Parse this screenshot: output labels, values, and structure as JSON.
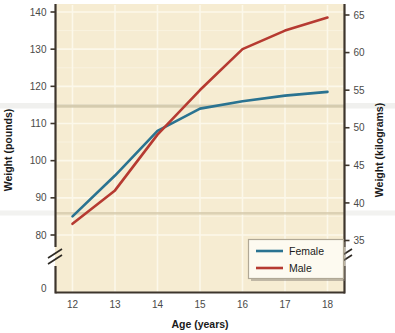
{
  "chart_data": {
    "type": "line",
    "title": "",
    "xlabel": "Age (years)",
    "ylabel": "Weight (pounds)",
    "y2label": "Weight (kilograms)",
    "x": [
      12,
      13,
      14,
      15,
      16,
      17,
      18
    ],
    "xtick_labels": [
      "12",
      "13",
      "14",
      "15",
      "16",
      "17",
      "18"
    ],
    "xlim": [
      11.6,
      18.4
    ],
    "ytick_labels": [
      "0",
      "80",
      "90",
      "100",
      "110",
      "120",
      "130",
      "140"
    ],
    "yticks": [
      0,
      80,
      90,
      100,
      110,
      120,
      130,
      140
    ],
    "ylim": [
      80,
      142
    ],
    "y_axis_break": true,
    "y2tick_labels": [
      "35",
      "40",
      "45",
      "50",
      "55",
      "60",
      "65"
    ],
    "y2ticks": [
      35,
      40,
      45,
      50,
      55,
      60,
      65
    ],
    "y2_axis_break": true,
    "grid": true,
    "legend_position": "bottom-right",
    "series": [
      {
        "name": "Female",
        "color": "#2a7391",
        "values": [
          85,
          96,
          108,
          114,
          116,
          117.5,
          118.5
        ],
        "values_kg": [
          38.6,
          43.5,
          49.0,
          51.7,
          52.6,
          53.3,
          53.7
        ]
      },
      {
        "name": "Male",
        "color": "#b63a31",
        "values": [
          83,
          92,
          107,
          119,
          130,
          135,
          138.5
        ],
        "values_kg": [
          37.6,
          41.7,
          48.5,
          54.0,
          59.0,
          61.2,
          62.8
        ]
      }
    ],
    "colors": {
      "plot_background": "#f6ecd2",
      "gridline": "#fbf6e6",
      "axis": "#3d352c",
      "legend_background": "#fdfaf0",
      "legend_border": "#8a8278",
      "page_background": "#ffffff"
    },
    "legend": [
      {
        "label": "Female",
        "color": "#2a7391"
      },
      {
        "label": "Male",
        "color": "#b63a31"
      }
    ]
  }
}
